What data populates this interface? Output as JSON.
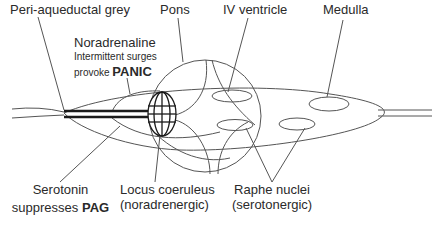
{
  "diagram": {
    "labels": {
      "pag": "Peri-aqueductal grey",
      "pons": "Pons",
      "iv_ventricle": "IV ventricle",
      "medulla": "Medulla",
      "noradrenaline": {
        "title": "Noradrenaline",
        "line2": "Intermittent surges",
        "line3_prefix": "provoke ",
        "line3_emphasis": "PANIC"
      },
      "serotonin": {
        "line1": "Serotonin",
        "line2_prefix": "suppresses ",
        "line2_emphasis": "PAG"
      },
      "locus_coeruleus": {
        "line1": "Locus coeruleus",
        "line2": "(noradrenergic)"
      },
      "raphe_nuclei": {
        "line1": "Raphe nuclei",
        "line2": "(serotonergic)"
      }
    },
    "colors": {
      "line": "#555555",
      "thick_line": "#1a1a1a",
      "text": "#2a2a2a",
      "background": "#ffffff"
    }
  }
}
